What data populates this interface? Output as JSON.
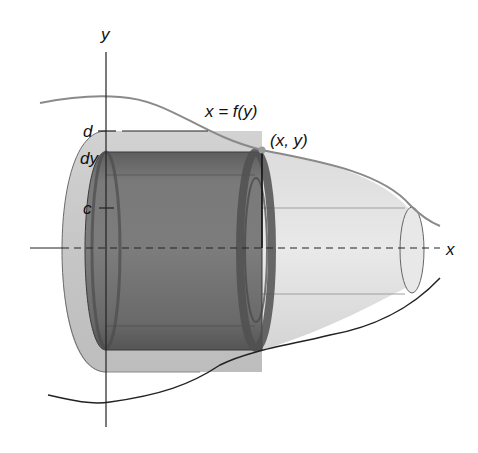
{
  "figure": {
    "labels": {
      "y_axis": "y",
      "x_axis": "x",
      "curve": "x = f(y)",
      "point": "(x, y)",
      "d": "d",
      "dy": "dy",
      "c": "c"
    },
    "colors": {
      "outer_solid": "#c9c9c9",
      "inner_shell": "#6e6e6e",
      "curve_top": "#8a8a8a",
      "axis": "#222222",
      "background": "#ffffff"
    }
  }
}
